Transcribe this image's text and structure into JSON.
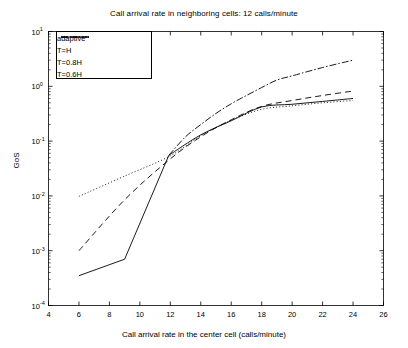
{
  "chart_data": {
    "type": "line",
    "title": "Call arrival rate in neighboring cells: 12 calls/minute",
    "xlabel": "Call arrival rate in the center cell (calls/minute)",
    "ylabel": "GoS",
    "xlim": [
      4,
      26
    ],
    "ylim": [
      0.0001,
      10
    ],
    "yscale": "log",
    "xscale": "linear",
    "grid": false,
    "legend_position": "upper left",
    "xticks": [
      4,
      6,
      8,
      10,
      12,
      14,
      16,
      18,
      20,
      22,
      24,
      26
    ],
    "xticklabels": [
      "4",
      "6",
      "8",
      "10",
      "12",
      "14",
      "16",
      "18",
      "20",
      "22",
      "24",
      "26"
    ],
    "yticks": [
      0.0001,
      0.001,
      0.01,
      0.1,
      1,
      10
    ],
    "yticklabels": [
      "10-4",
      "10-3",
      "10-2",
      "10-1",
      "100",
      "101"
    ],
    "yticklabels_parts": [
      {
        "base": "10",
        "exp": "-4"
      },
      {
        "base": "10",
        "exp": "-3"
      },
      {
        "base": "10",
        "exp": "-2"
      },
      {
        "base": "10",
        "exp": "-1"
      },
      {
        "base": "10",
        "exp": "0"
      },
      {
        "base": "10",
        "exp": "1"
      }
    ],
    "series": [
      {
        "name": "adaptive",
        "style": "solid",
        "color": "#000000",
        "x": [
          6,
          9,
          11.9,
          14,
          16,
          18,
          20,
          22,
          24
        ],
        "y": [
          0.00035,
          0.0007,
          0.055,
          0.13,
          0.235,
          0.42,
          0.47,
          0.53,
          0.6
        ]
      },
      {
        "name": "T=H",
        "style": "dashdot",
        "color": "#000000",
        "x": [
          11.9,
          13,
          14,
          15,
          16,
          17,
          18,
          19,
          20,
          22,
          24
        ],
        "y": [
          0.055,
          0.12,
          0.2,
          0.32,
          0.48,
          0.68,
          0.95,
          1.3,
          1.55,
          2.2,
          3.0
        ]
      },
      {
        "name": "T=0.8H",
        "style": "dashed",
        "color": "#000000",
        "x": [
          6,
          9,
          11.9,
          14,
          16,
          18,
          20,
          22,
          24
        ],
        "y": [
          0.001,
          0.0085,
          0.045,
          0.12,
          0.245,
          0.43,
          0.55,
          0.68,
          0.82
        ]
      },
      {
        "name": "T=0.6H",
        "style": "dotted",
        "color": "#000000",
        "x": [
          6,
          9,
          11.9,
          14,
          16,
          18,
          20,
          22,
          24
        ],
        "y": [
          0.0098,
          0.023,
          0.052,
          0.125,
          0.24,
          0.38,
          0.44,
          0.5,
          0.55
        ]
      }
    ]
  },
  "legend": {
    "items": [
      {
        "label": "adaptive",
        "style": "solid"
      },
      {
        "label": "T=H",
        "style": "dashdot"
      },
      {
        "label": "T=0.8H",
        "style": "dashed"
      },
      {
        "label": "T=0.6H",
        "style": "dotted"
      }
    ]
  }
}
